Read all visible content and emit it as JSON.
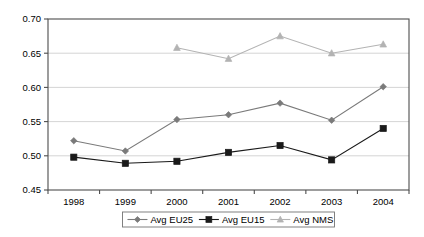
{
  "chart_data": {
    "type": "line",
    "title": "",
    "xlabel": "",
    "ylabel": "",
    "categories": [
      "1998",
      "1999",
      "2000",
      "2001",
      "2002",
      "2003",
      "2004"
    ],
    "ylim": [
      0.45,
      0.7
    ],
    "ytick_labels": [
      "0.70",
      "0.65",
      "0.60",
      "0.55",
      "0.50",
      "0.45"
    ],
    "ytick_values": [
      0.7,
      0.65,
      0.6,
      0.55,
      0.5,
      0.45
    ],
    "grid": true,
    "legend_position": "bottom",
    "series": [
      {
        "name": "Avg EU25",
        "marker": "diamond",
        "color": "#7a7a7a",
        "values": [
          0.522,
          0.507,
          0.553,
          0.56,
          0.577,
          0.552,
          0.601
        ]
      },
      {
        "name": "Avg EU15",
        "marker": "square",
        "color": "#1a1a1a",
        "values": [
          0.498,
          0.489,
          0.492,
          0.505,
          0.515,
          0.494,
          0.54
        ]
      },
      {
        "name": "Avg NMS",
        "marker": "triangle",
        "color": "#b3b3b3",
        "values": [
          null,
          null,
          0.658,
          0.642,
          0.675,
          0.65,
          0.663
        ]
      }
    ]
  }
}
